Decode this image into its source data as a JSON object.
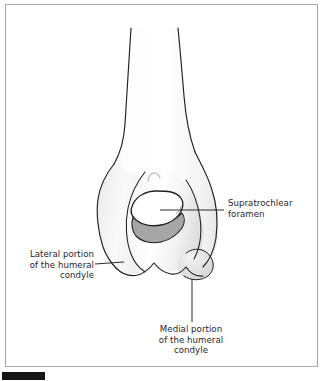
{
  "figure": {
    "view": "cranial"
  },
  "labels": {
    "supratrochlear": {
      "line1": "Supratrochlear",
      "line2": "foramen",
      "full": "Supratrochlear foramen"
    },
    "lateral": {
      "line1": "Lateral portion",
      "line2": "of the humeral",
      "line3": "condyle",
      "full": "Lateral portion of the humeral condyle"
    },
    "medial": {
      "line1": "Medial portion",
      "line2": "of the humeral",
      "line3": "condyle",
      "full": "Medial portion of the humeral condyle"
    }
  },
  "colors": {
    "frame_border": "#a8a8ac",
    "background": "#ffffff",
    "bone_outline": "#231f20",
    "bone_fill": "#ffffff",
    "shading_light": "#f0f0f0",
    "shading_mid": "#e3e3e3",
    "shading_dark": "#a8a8a8",
    "foramen_fill": "#ffffff",
    "leader_line": "#231f20",
    "text": "#272429",
    "marker_bar": "#151515"
  },
  "leader_lines": {
    "supratrochlear": {
      "orientation": "horizontal",
      "from_x": 160,
      "from_y": 210,
      "to_x": 224,
      "to_y": 210
    },
    "lateral": {
      "orientation": "horizontal",
      "from_x": 95,
      "from_y": 265,
      "to_x": 122,
      "to_y": 262
    },
    "medial": {
      "orientation": "vertical",
      "from_x": 192,
      "from_y": 278,
      "to_x": 192,
      "to_y": 322
    }
  },
  "parts": [
    {
      "name": "humeral-shaft",
      "description": "diaphysis of the humerus"
    },
    {
      "name": "supratrochlear-foramen",
      "description": "oval opening through the distal humerus"
    },
    {
      "name": "trochlea",
      "description": "dark grey articular trochlear surface"
    },
    {
      "name": "lateral-condyle",
      "description": "lateral portion of the humeral condyle"
    },
    {
      "name": "medial-condyle",
      "description": "medial portion of the humeral condyle"
    },
    {
      "name": "lateral-epicondyle",
      "description": "lateral epicondylar crest"
    },
    {
      "name": "olecranon-fossa-arc",
      "description": "faint arc above the foramen"
    }
  ]
}
